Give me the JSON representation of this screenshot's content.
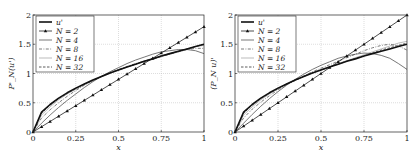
{
  "chart_data": [
    {
      "type": "line",
      "title": "",
      "xlabel": "x",
      "ylabel": "P'_N(u')",
      "xlim": [
        0,
        1
      ],
      "ylim": [
        0,
        2
      ],
      "xticks": [
        "0",
        "0.25",
        "0.5",
        "0.75",
        "1"
      ],
      "yticks": [
        "0",
        "0.5",
        "1",
        "1.5",
        "2"
      ],
      "grid": true,
      "legend_position": "top-left",
      "x": [
        0,
        0.05,
        0.1,
        0.15,
        0.2,
        0.25,
        0.3,
        0.35,
        0.4,
        0.45,
        0.5,
        0.55,
        0.6,
        0.65,
        0.7,
        0.75,
        0.8,
        0.85,
        0.9,
        0.95,
        1.0
      ],
      "series": [
        {
          "name": "u'",
          "style": "thick",
          "values": [
            0,
            0.34,
            0.47,
            0.58,
            0.67,
            0.75,
            0.82,
            0.89,
            0.95,
            1.01,
            1.06,
            1.11,
            1.16,
            1.21,
            1.25,
            1.3,
            1.34,
            1.38,
            1.42,
            1.46,
            1.5
          ]
        },
        {
          "name": "N = 2",
          "style": "triangle-marker",
          "values": [
            0,
            0.09,
            0.18,
            0.27,
            0.36,
            0.45,
            0.54,
            0.63,
            0.72,
            0.81,
            0.9,
            0.99,
            1.08,
            1.17,
            1.26,
            1.35,
            1.44,
            1.53,
            1.62,
            1.71,
            1.8
          ]
        },
        {
          "name": "N = 4",
          "style": "solid-thin",
          "values": [
            0,
            0.15,
            0.29,
            0.42,
            0.54,
            0.65,
            0.76,
            0.86,
            0.95,
            1.03,
            1.1,
            1.17,
            1.23,
            1.28,
            1.33,
            1.37,
            1.39,
            1.41,
            1.41,
            1.39,
            1.34
          ]
        },
        {
          "name": "N = 8",
          "style": "dash-dot",
          "values": [
            0,
            0.24,
            0.38,
            0.5,
            0.61,
            0.71,
            0.8,
            0.88,
            0.95,
            1.01,
            1.07,
            1.12,
            1.17,
            1.21,
            1.25,
            1.29,
            1.33,
            1.37,
            1.41,
            1.43,
            1.43
          ]
        },
        {
          "name": "N = 16",
          "style": "light-solid",
          "values": [
            0,
            0.29,
            0.43,
            0.55,
            0.65,
            0.73,
            0.81,
            0.88,
            0.94,
            1.0,
            1.06,
            1.11,
            1.16,
            1.2,
            1.25,
            1.29,
            1.33,
            1.37,
            1.41,
            1.46,
            1.48
          ]
        },
        {
          "name": "N = 32",
          "style": "dashed",
          "values": [
            0,
            0.32,
            0.46,
            0.57,
            0.66,
            0.74,
            0.82,
            0.88,
            0.95,
            1.01,
            1.06,
            1.11,
            1.16,
            1.21,
            1.25,
            1.3,
            1.34,
            1.38,
            1.42,
            1.46,
            1.5
          ]
        }
      ]
    },
    {
      "type": "line",
      "title": "",
      "xlabel": "x",
      "ylabel": "(P_N u)'",
      "xlim": [
        0,
        1
      ],
      "ylim": [
        0,
        2
      ],
      "xticks": [
        "0",
        "0.25",
        "0.5",
        "0.75",
        "1"
      ],
      "yticks": [
        "0",
        "0.5",
        "1",
        "1.5",
        "2"
      ],
      "grid": true,
      "legend_position": "top-left",
      "x": [
        0,
        0.05,
        0.1,
        0.15,
        0.2,
        0.25,
        0.3,
        0.35,
        0.4,
        0.45,
        0.5,
        0.55,
        0.6,
        0.65,
        0.7,
        0.75,
        0.8,
        0.85,
        0.9,
        0.95,
        1.0
      ],
      "series": [
        {
          "name": "u'",
          "style": "thick",
          "values": [
            0,
            0.34,
            0.47,
            0.58,
            0.67,
            0.75,
            0.82,
            0.89,
            0.95,
            1.01,
            1.06,
            1.11,
            1.16,
            1.21,
            1.25,
            1.3,
            1.34,
            1.38,
            1.42,
            1.46,
            1.5
          ]
        },
        {
          "name": "N = 2",
          "style": "triangle-marker",
          "values": [
            0,
            0.1,
            0.2,
            0.3,
            0.4,
            0.5,
            0.6,
            0.7,
            0.8,
            0.9,
            1.0,
            1.1,
            1.2,
            1.3,
            1.4,
            1.5,
            1.6,
            1.7,
            1.8,
            1.9,
            2.0
          ]
        },
        {
          "name": "N = 4",
          "style": "solid-thin",
          "values": [
            0,
            0.15,
            0.3,
            0.44,
            0.57,
            0.69,
            0.8,
            0.9,
            0.99,
            1.07,
            1.14,
            1.2,
            1.26,
            1.3,
            1.33,
            1.35,
            1.34,
            1.31,
            1.26,
            1.17,
            1.07
          ]
        },
        {
          "name": "N = 8",
          "style": "dash-dot",
          "values": [
            0,
            0.24,
            0.39,
            0.51,
            0.62,
            0.72,
            0.81,
            0.89,
            0.96,
            1.03,
            1.09,
            1.15,
            1.21,
            1.27,
            1.33,
            1.39,
            1.44,
            1.48,
            1.5,
            1.47,
            1.4
          ]
        },
        {
          "name": "N = 16",
          "style": "light-solid",
          "values": [
            0,
            0.29,
            0.43,
            0.55,
            0.65,
            0.74,
            0.82,
            0.89,
            0.95,
            1.01,
            1.07,
            1.12,
            1.17,
            1.22,
            1.27,
            1.32,
            1.37,
            1.42,
            1.47,
            1.52,
            1.55
          ]
        },
        {
          "name": "N = 32",
          "style": "dashed",
          "values": [
            0,
            0.32,
            0.46,
            0.57,
            0.66,
            0.74,
            0.82,
            0.88,
            0.95,
            1.01,
            1.06,
            1.11,
            1.16,
            1.21,
            1.26,
            1.3,
            1.35,
            1.4,
            1.44,
            1.48,
            1.52
          ]
        }
      ]
    }
  ]
}
